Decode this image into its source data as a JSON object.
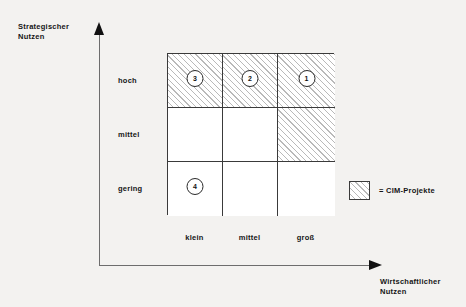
{
  "chart_data": {
    "type": "heatmap",
    "title": "",
    "xlabel": "Wirtschaftlicher\nNutzen",
    "ylabel": "Strategischer\nNutzen",
    "x_categories": [
      "klein",
      "mittel",
      "groß"
    ],
    "y_categories": [
      "hoch",
      "mittel",
      "gering"
    ],
    "grid": true,
    "legend_position": "right",
    "legend": [
      {
        "swatch": "hatched",
        "label": "= CIM-Projekte"
      }
    ],
    "cells": [
      {
        "row": 0,
        "col": 0,
        "y": "hoch",
        "x": "klein",
        "hatched": true,
        "marker": "3"
      },
      {
        "row": 0,
        "col": 1,
        "y": "hoch",
        "x": "mittel",
        "hatched": true,
        "marker": "2"
      },
      {
        "row": 0,
        "col": 2,
        "y": "hoch",
        "x": "groß",
        "hatched": true,
        "marker": "1"
      },
      {
        "row": 1,
        "col": 0,
        "y": "mittel",
        "x": "klein",
        "hatched": false,
        "marker": ""
      },
      {
        "row": 1,
        "col": 1,
        "y": "mittel",
        "x": "mittel",
        "hatched": false,
        "marker": ""
      },
      {
        "row": 1,
        "col": 2,
        "y": "mittel",
        "x": "groß",
        "hatched": true,
        "marker": ""
      },
      {
        "row": 2,
        "col": 0,
        "y": "gering",
        "x": "klein",
        "hatched": false,
        "marker": "4"
      },
      {
        "row": 2,
        "col": 1,
        "y": "gering",
        "x": "mittel",
        "hatched": false,
        "marker": ""
      },
      {
        "row": 2,
        "col": 2,
        "y": "gering",
        "x": "groß",
        "hatched": false,
        "marker": ""
      }
    ],
    "markers": [
      {
        "id": "1",
        "x": "groß",
        "y": "hoch"
      },
      {
        "id": "2",
        "x": "mittel",
        "y": "hoch"
      },
      {
        "id": "3",
        "x": "klein",
        "y": "hoch"
      },
      {
        "id": "4",
        "x": "klein",
        "y": "gering"
      }
    ],
    "colors": {
      "background": "#f3f2f0",
      "cell_fill": "#ffffff",
      "hatch": "#b9b9b9",
      "line": "#3a3a3a",
      "axis": "#6d6d6d",
      "text": "#151515"
    }
  },
  "axes": {
    "y_title": "Strategischer\nNutzen",
    "x_title": "Wirtschaftlicher\nNutzen",
    "y_ticks": [
      "hoch",
      "mittel",
      "gering"
    ],
    "x_ticks": [
      "klein",
      "mittel",
      "groß"
    ]
  },
  "legend": {
    "label": "= CIM-Projekte"
  },
  "markers": {
    "m1": "1",
    "m2": "2",
    "m3": "3",
    "m4": "4"
  }
}
